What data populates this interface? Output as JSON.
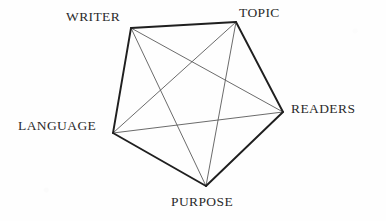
{
  "diagram": {
    "type": "pentagon-network",
    "title": "",
    "background_color": "#fefefe",
    "edge_color": "#1f1f1f",
    "diagonal_color": "#5a5a5a",
    "label_color": "#2b2b2b",
    "vertices": [
      {
        "id": "writer",
        "label": "WRITER",
        "x": 131,
        "y": 28,
        "label_x": 66,
        "label_y": 10
      },
      {
        "id": "topic",
        "label": "TOPIC",
        "x": 236,
        "y": 22,
        "label_x": 239,
        "label_y": 6
      },
      {
        "id": "readers",
        "label": "READERS",
        "x": 283,
        "y": 112,
        "label_x": 291,
        "label_y": 102
      },
      {
        "id": "purpose",
        "label": "PURPOSE",
        "x": 206,
        "y": 186,
        "label_x": 171,
        "label_y": 195
      },
      {
        "id": "language",
        "label": "LANGUAGE",
        "x": 113,
        "y": 133,
        "label_x": 18,
        "label_y": 119
      }
    ],
    "perimeter_edges": [
      {
        "from": "writer",
        "to": "topic"
      },
      {
        "from": "topic",
        "to": "readers"
      },
      {
        "from": "readers",
        "to": "purpose"
      },
      {
        "from": "purpose",
        "to": "language"
      },
      {
        "from": "language",
        "to": "writer"
      }
    ],
    "diagonal_edges": [
      {
        "from": "writer",
        "to": "readers"
      },
      {
        "from": "writer",
        "to": "purpose"
      },
      {
        "from": "topic",
        "to": "purpose"
      },
      {
        "from": "topic",
        "to": "language"
      },
      {
        "from": "readers",
        "to": "language"
      }
    ]
  }
}
